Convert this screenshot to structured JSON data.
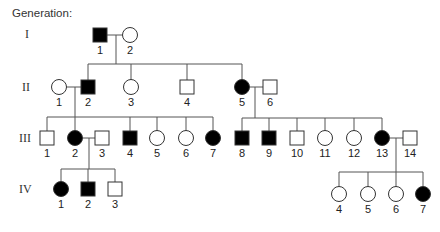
{
  "title": "Generation:",
  "colors": {
    "affected": "#000000",
    "unaffected": "#ffffff",
    "line": "#555555"
  },
  "generations": [
    {
      "label": "I",
      "x": 25,
      "y": 34
    },
    {
      "label": "II",
      "x": 22,
      "y": 87
    },
    {
      "label": "III",
      "x": 19,
      "y": 138
    },
    {
      "label": "IV",
      "x": 19,
      "y": 189
    }
  ],
  "individuals": [
    {
      "id": "I-1",
      "gen": "I",
      "num": "1",
      "sex": "male",
      "affected": true,
      "x": 100,
      "y": 35
    },
    {
      "id": "I-2",
      "gen": "I",
      "num": "2",
      "sex": "female",
      "affected": false,
      "x": 130,
      "y": 35
    },
    {
      "id": "II-1",
      "gen": "II",
      "num": "1",
      "sex": "female",
      "affected": false,
      "x": 59,
      "y": 87
    },
    {
      "id": "II-2",
      "gen": "II",
      "num": "2",
      "sex": "male",
      "affected": true,
      "x": 88,
      "y": 87
    },
    {
      "id": "II-3",
      "gen": "II",
      "num": "3",
      "sex": "female",
      "affected": false,
      "x": 131,
      "y": 87
    },
    {
      "id": "II-4",
      "gen": "II",
      "num": "4",
      "sex": "male",
      "affected": false,
      "x": 187,
      "y": 87
    },
    {
      "id": "II-5",
      "gen": "II",
      "num": "5",
      "sex": "female",
      "affected": true,
      "x": 242,
      "y": 87
    },
    {
      "id": "II-6",
      "gen": "II",
      "num": "6",
      "sex": "male",
      "affected": false,
      "x": 270,
      "y": 87
    },
    {
      "id": "III-1",
      "gen": "III",
      "num": "1",
      "sex": "male",
      "affected": false,
      "x": 47,
      "y": 138
    },
    {
      "id": "III-2",
      "gen": "III",
      "num": "2",
      "sex": "female",
      "affected": true,
      "x": 75,
      "y": 138
    },
    {
      "id": "III-3",
      "gen": "III",
      "num": "3",
      "sex": "male",
      "affected": false,
      "x": 102,
      "y": 138
    },
    {
      "id": "III-4",
      "gen": "III",
      "num": "4",
      "sex": "male",
      "affected": true,
      "x": 130,
      "y": 138
    },
    {
      "id": "III-5",
      "gen": "III",
      "num": "5",
      "sex": "female",
      "affected": false,
      "x": 157,
      "y": 138
    },
    {
      "id": "III-6",
      "gen": "III",
      "num": "6",
      "sex": "female",
      "affected": false,
      "x": 186,
      "y": 138
    },
    {
      "id": "III-7",
      "gen": "III",
      "num": "7",
      "sex": "female",
      "affected": true,
      "x": 213,
      "y": 138
    },
    {
      "id": "III-8",
      "gen": "III",
      "num": "8",
      "sex": "male",
      "affected": true,
      "x": 242,
      "y": 138
    },
    {
      "id": "III-9",
      "gen": "III",
      "num": "9",
      "sex": "male",
      "affected": true,
      "x": 269,
      "y": 138
    },
    {
      "id": "III-10",
      "gen": "III",
      "num": "10",
      "sex": "male",
      "affected": false,
      "x": 297,
      "y": 138
    },
    {
      "id": "III-11",
      "gen": "III",
      "num": "11",
      "sex": "female",
      "affected": false,
      "x": 325,
      "y": 138
    },
    {
      "id": "III-12",
      "gen": "III",
      "num": "12",
      "sex": "female",
      "affected": false,
      "x": 354,
      "y": 138
    },
    {
      "id": "III-13",
      "gen": "III",
      "num": "13",
      "sex": "female",
      "affected": true,
      "x": 382,
      "y": 138
    },
    {
      "id": "III-14",
      "gen": "III",
      "num": "14",
      "sex": "male",
      "affected": false,
      "x": 410,
      "y": 138
    },
    {
      "id": "IV-1",
      "gen": "IV",
      "num": "1",
      "sex": "female",
      "affected": true,
      "x": 61,
      "y": 189
    },
    {
      "id": "IV-2",
      "gen": "IV",
      "num": "2",
      "sex": "male",
      "affected": true,
      "x": 88,
      "y": 189
    },
    {
      "id": "IV-3",
      "gen": "IV",
      "num": "3",
      "sex": "male",
      "affected": false,
      "x": 115,
      "y": 189
    },
    {
      "id": "IV-4",
      "gen": "IV",
      "num": "4",
      "sex": "female",
      "affected": false,
      "x": 339,
      "y": 194
    },
    {
      "id": "IV-5",
      "gen": "IV",
      "num": "5",
      "sex": "female",
      "affected": false,
      "x": 368,
      "y": 194
    },
    {
      "id": "IV-6",
      "gen": "IV",
      "num": "6",
      "sex": "female",
      "affected": false,
      "x": 396,
      "y": 194
    },
    {
      "id": "IV-7",
      "gen": "IV",
      "num": "7",
      "sex": "female",
      "affected": true,
      "x": 423,
      "y": 194
    }
  ],
  "matings": [
    {
      "partners": [
        "I-1",
        "I-2"
      ],
      "y": 35,
      "dropX": 116,
      "sibY": 64,
      "children": [
        "II-2",
        "II-3",
        "II-4",
        "II-5"
      ]
    },
    {
      "partners": [
        "II-1",
        "II-2"
      ],
      "y": 87,
      "dropX": 75,
      "sibY": 117,
      "children": [
        "III-1",
        "III-2",
        "III-4",
        "III-5",
        "III-6",
        "III-7"
      ]
    },
    {
      "partners": [
        "II-5",
        "II-6"
      ],
      "y": 87,
      "dropX": 255,
      "sibY": 118,
      "children": [
        "III-8",
        "III-9",
        "III-10",
        "III-11",
        "III-12",
        "III-13"
      ]
    },
    {
      "partners": [
        "III-2",
        "III-3"
      ],
      "y": 138,
      "dropX": 89,
      "sibY": 169,
      "children": [
        "IV-1",
        "IV-2",
        "IV-3"
      ]
    },
    {
      "partners": [
        "III-13",
        "III-14"
      ],
      "y": 138,
      "dropX": 396,
      "sibY": 172,
      "children": [
        "IV-4",
        "IV-5",
        "IV-6",
        "IV-7"
      ]
    }
  ],
  "symbol_size": 14
}
